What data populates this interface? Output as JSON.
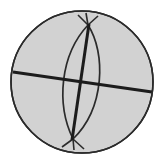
{
  "figure": {
    "canvas": {
      "width": 164,
      "height": 163
    },
    "background_color": "#ffffff"
  },
  "chart_data": {
    "type": "diagram",
    "xlabel": "",
    "ylabel": "",
    "xlim": [
      0,
      164
    ],
    "ylim": [
      0,
      163
    ],
    "grid": false,
    "legend": "none",
    "elements": [
      {
        "name": "sphere-disc",
        "shape": "circle",
        "cx": 82,
        "cy": 82,
        "r": 71,
        "fill": "#d2d2d2",
        "stroke": "#2b2b2b",
        "stroke_width": 1.6
      },
      {
        "name": "equator-line",
        "shape": "line",
        "x1": 13,
        "y1": 72,
        "x2": 152,
        "y2": 92,
        "stroke": "#1c1c1c",
        "stroke_width": 3.2
      },
      {
        "name": "polar-axis-line",
        "shape": "line",
        "x1": 89,
        "y1": 24,
        "x2": 72,
        "y2": 140,
        "stroke": "#1c1c1c",
        "stroke_width": 3.0
      },
      {
        "name": "meridian-arc-left",
        "shape": "arc",
        "path": "M 88 25 C 60 55, 56 104, 73 139",
        "stroke": "#2b2b2b",
        "stroke_width": 1.7
      },
      {
        "name": "meridian-arc-right",
        "shape": "arc",
        "path": "M 88 25 C 106 53, 105 108, 73 139",
        "stroke": "#2b2b2b",
        "stroke_width": 1.7
      },
      {
        "name": "north-pole-node",
        "shape": "point",
        "cx": 88,
        "cy": 25
      },
      {
        "name": "south-pole-node",
        "shape": "point",
        "cx": 73,
        "cy": 139
      },
      {
        "name": "north-pole-tick-left",
        "shape": "line",
        "x1": 88,
        "y1": 25,
        "x2": 78,
        "y2": 15,
        "stroke": "#2b2b2b",
        "stroke_width": 1.6
      },
      {
        "name": "north-pole-tick-right",
        "shape": "line",
        "x1": 88,
        "y1": 25,
        "x2": 98,
        "y2": 16,
        "stroke": "#2b2b2b",
        "stroke_width": 1.6
      },
      {
        "name": "north-pole-tick-up",
        "shape": "line",
        "x1": 88,
        "y1": 25,
        "x2": 86,
        "y2": 13,
        "stroke": "#2b2b2b",
        "stroke_width": 1.6
      },
      {
        "name": "south-pole-tick-left",
        "shape": "line",
        "x1": 73,
        "y1": 139,
        "x2": 62,
        "y2": 147,
        "stroke": "#2b2b2b",
        "stroke_width": 1.6
      },
      {
        "name": "south-pole-tick-right",
        "shape": "line",
        "x1": 73,
        "y1": 139,
        "x2": 84,
        "y2": 149,
        "stroke": "#2b2b2b",
        "stroke_width": 1.6
      },
      {
        "name": "south-pole-tick-down",
        "shape": "line",
        "x1": 73,
        "y1": 139,
        "x2": 74,
        "y2": 150,
        "stroke": "#2b2b2b",
        "stroke_width": 1.6
      }
    ]
  },
  "colors": {
    "sphere_fill": "#d2d2d2",
    "outline": "#2b2b2b",
    "bold_line": "#1c1c1c",
    "background": "#ffffff"
  },
  "labels": {
    "figure_caption": ""
  }
}
